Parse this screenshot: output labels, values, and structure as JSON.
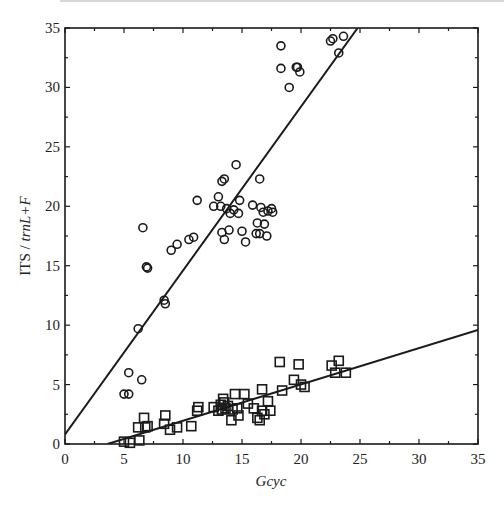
{
  "chart_data": {
    "type": "scatter",
    "title": "",
    "xlabel": "Gcyc",
    "ylabel": "ITS / trnL+F",
    "xlim": [
      0,
      35
    ],
    "ylim": [
      0,
      35
    ],
    "xticks": [
      0,
      5,
      10,
      15,
      20,
      25,
      30,
      35
    ],
    "yticks": [
      0,
      5,
      10,
      15,
      20,
      25,
      30,
      35
    ],
    "grid": false,
    "legend": null,
    "series": [
      {
        "name": "ITS",
        "marker": "circle",
        "points": [
          [
            5.0,
            4.2
          ],
          [
            5.4,
            4.2
          ],
          [
            5.4,
            6.0
          ],
          [
            6.5,
            5.4
          ],
          [
            6.2,
            9.7
          ],
          [
            6.6,
            18.2
          ],
          [
            6.9,
            14.9
          ],
          [
            7.0,
            14.8
          ],
          [
            8.4,
            12.1
          ],
          [
            8.5,
            11.8
          ],
          [
            9.0,
            16.3
          ],
          [
            9.5,
            16.8
          ],
          [
            10.5,
            17.2
          ],
          [
            10.9,
            17.4
          ],
          [
            11.2,
            20.5
          ],
          [
            12.6,
            20.0
          ],
          [
            13.0,
            20.8
          ],
          [
            13.3,
            22.1
          ],
          [
            13.5,
            22.3
          ],
          [
            13.3,
            17.8
          ],
          [
            13.5,
            17.2
          ],
          [
            13.7,
            19.8
          ],
          [
            13.2,
            20.0
          ],
          [
            13.9,
            18.0
          ],
          [
            14.0,
            19.4
          ],
          [
            14.3,
            19.7
          ],
          [
            14.5,
            23.5
          ],
          [
            14.8,
            20.5
          ],
          [
            14.7,
            19.4
          ],
          [
            15.0,
            17.9
          ],
          [
            15.3,
            17.0
          ],
          [
            15.9,
            20.1
          ],
          [
            16.2,
            17.7
          ],
          [
            16.3,
            18.6
          ],
          [
            16.5,
            22.3
          ],
          [
            16.5,
            17.7
          ],
          [
            16.6,
            19.9
          ],
          [
            16.8,
            19.5
          ],
          [
            16.9,
            18.5
          ],
          [
            17.1,
            17.5
          ],
          [
            17.2,
            19.6
          ],
          [
            17.5,
            19.8
          ],
          [
            17.6,
            19.5
          ],
          [
            18.3,
            33.5
          ],
          [
            18.3,
            31.6
          ],
          [
            19.0,
            30.0
          ],
          [
            19.6,
            31.7
          ],
          [
            19.9,
            31.3
          ],
          [
            19.7,
            31.7
          ],
          [
            22.5,
            33.9
          ],
          [
            22.7,
            34.1
          ],
          [
            23.2,
            32.9
          ],
          [
            23.6,
            34.3
          ]
        ],
        "fit_line": [
          [
            0,
            0.8
          ],
          [
            24.8,
            35
          ]
        ]
      },
      {
        "name": "trnL+F",
        "marker": "square",
        "points": [
          [
            5.0,
            0.2
          ],
          [
            5.5,
            0.1
          ],
          [
            6.3,
            0.3
          ],
          [
            6.2,
            1.4
          ],
          [
            6.7,
            2.2
          ],
          [
            6.8,
            1.4
          ],
          [
            7.0,
            1.5
          ],
          [
            8.4,
            1.7
          ],
          [
            8.5,
            2.4
          ],
          [
            8.9,
            1.2
          ],
          [
            9.5,
            1.4
          ],
          [
            10.7,
            1.5
          ],
          [
            11.2,
            2.8
          ],
          [
            11.3,
            3.1
          ],
          [
            12.6,
            3.1
          ],
          [
            13.0,
            2.8
          ],
          [
            13.2,
            3.3
          ],
          [
            13.4,
            3.8
          ],
          [
            13.5,
            3.5
          ],
          [
            13.3,
            2.9
          ],
          [
            13.6,
            3.0
          ],
          [
            13.8,
            3.2
          ],
          [
            14.1,
            2.0
          ],
          [
            14.2,
            2.9
          ],
          [
            14.4,
            4.2
          ],
          [
            14.6,
            3.0
          ],
          [
            14.7,
            2.4
          ],
          [
            15.2,
            4.2
          ],
          [
            15.5,
            3.4
          ],
          [
            16.0,
            3.0
          ],
          [
            16.3,
            2.2
          ],
          [
            16.5,
            2.0
          ],
          [
            16.7,
            4.6
          ],
          [
            16.7,
            2.8
          ],
          [
            16.9,
            2.5
          ],
          [
            17.2,
            3.6
          ],
          [
            17.4,
            2.8
          ],
          [
            18.2,
            6.9
          ],
          [
            18.4,
            4.5
          ],
          [
            19.4,
            5.4
          ],
          [
            19.8,
            6.7
          ],
          [
            20.0,
            5.0
          ],
          [
            20.3,
            4.8
          ],
          [
            22.6,
            6.6
          ],
          [
            22.9,
            6.0
          ],
          [
            23.2,
            7.0
          ],
          [
            23.8,
            6.0
          ]
        ],
        "fit_line": [
          [
            3.6,
            0
          ],
          [
            35,
            9.6
          ]
        ]
      }
    ]
  },
  "labels": {
    "xlabel": "Gcyc",
    "ylabel_main": "ITS / ",
    "ylabel_italic": "trnL+F"
  }
}
